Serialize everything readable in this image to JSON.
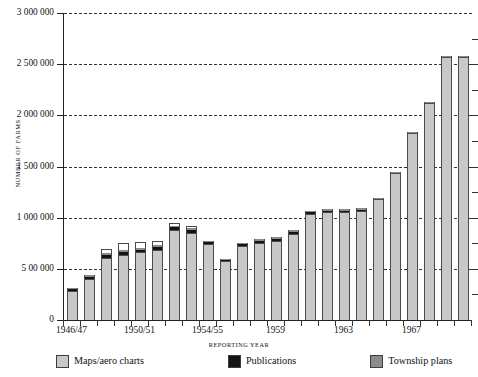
{
  "chart_data": {
    "type": "bar",
    "stacked": true,
    "title": "",
    "xlabel": "REPORTING YEAR",
    "ylabel": "NUMBER OF FARMS",
    "ylim": [
      0,
      3000000
    ],
    "ytick_values": [
      0,
      500000,
      1000000,
      1500000,
      2000000,
      2500000,
      3000000
    ],
    "ytick_labels": [
      "0",
      "5 00 000",
      "1 000 000",
      "1 500 000",
      "2 000 000",
      "2 500 000",
      "3 000 000"
    ],
    "grid": "horizontal-dashed",
    "legend_position": "bottom",
    "categories": [
      "1946/47",
      "1947/48",
      "1948/49",
      "1949/50",
      "1950/51",
      "1951/52",
      "1952/53",
      "1953/54",
      "1954/55",
      "1955/56",
      "1956/57",
      "1957/58",
      "1959",
      "1960",
      "1961",
      "1962",
      "1963",
      "1964",
      "1965",
      "1966",
      "1967",
      "1968",
      "1969",
      "1970"
    ],
    "xtick_labels": [
      "1946/47",
      "1950/51",
      "1954/55",
      "1959",
      "1963",
      "1967"
    ],
    "xtick_label_indices": [
      0,
      4,
      8,
      12,
      16,
      20
    ],
    "series": [
      {
        "name": "Maps/aero charts",
        "color": "#c8c8c8",
        "values": [
          285000,
          400000,
          610000,
          635000,
          660000,
          685000,
          880000,
          855000,
          750000,
          580000,
          720000,
          755000,
          770000,
          840000,
          1040000,
          1060000,
          1060000,
          1080000,
          1190000,
          1440000,
          1830000,
          2130000,
          2570000,
          2570000
        ]
      },
      {
        "name": "Publications",
        "color": "#141414",
        "values": [
          20000,
          25000,
          25000,
          25000,
          25000,
          25000,
          30000,
          30000,
          10000,
          10000,
          20000,
          20000,
          25000,
          25000,
          15000,
          10000,
          10000,
          5000,
          0,
          0,
          0,
          0,
          0,
          0
        ]
      },
      {
        "name": "Township plans",
        "color": "#8c8c8c",
        "values": [
          10000,
          20000,
          20000,
          25000,
          20000,
          20000,
          10000,
          10000,
          10000,
          10000,
          15000,
          15000,
          15000,
          15000,
          10000,
          10000,
          10000,
          5000,
          5000,
          10000,
          5000,
          5000,
          10000,
          10000
        ]
      },
      {
        "name": "Air info. pubs.",
        "color": "#ffffff",
        "values": [
          0,
          0,
          35000,
          65000,
          55000,
          45000,
          30000,
          20000,
          0,
          0,
          0,
          0,
          0,
          0,
          0,
          0,
          0,
          0,
          0,
          0,
          0,
          0,
          0,
          0
        ]
      }
    ],
    "totals": [
      315000,
      445000,
      690000,
      750000,
      760000,
      775000,
      950000,
      915000,
      770000,
      600000,
      755000,
      790000,
      810000,
      880000,
      1065000,
      1080000,
      1080000,
      1090000,
      1195000,
      1450000,
      1835000,
      2135000,
      2580000,
      2580000
    ]
  },
  "legend": {
    "items": [
      {
        "label": "Maps/aero charts",
        "color": "#c8c8c8",
        "name": "maps-aero-charts"
      },
      {
        "label": "Publications",
        "color": "#141414",
        "name": "publications"
      },
      {
        "label": "Township plans",
        "color": "#8c8c8c",
        "name": "township-plans"
      },
      {
        "label": "Air info. pubs.",
        "color": "#ffffff",
        "name": "air-info-pubs"
      }
    ]
  }
}
